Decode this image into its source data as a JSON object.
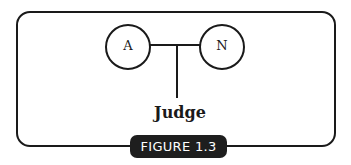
{
  "diagram": {
    "nodes": [
      {
        "id": "A",
        "label": "A"
      },
      {
        "id": "N",
        "label": "N"
      }
    ],
    "connector_label": "Judge",
    "caption": "FIGURE 1.3",
    "colors": {
      "stroke": "#1a1a1a",
      "badge_bg": "#1e1e1e",
      "badge_text": "#ffffff",
      "background": "#ffffff"
    }
  }
}
